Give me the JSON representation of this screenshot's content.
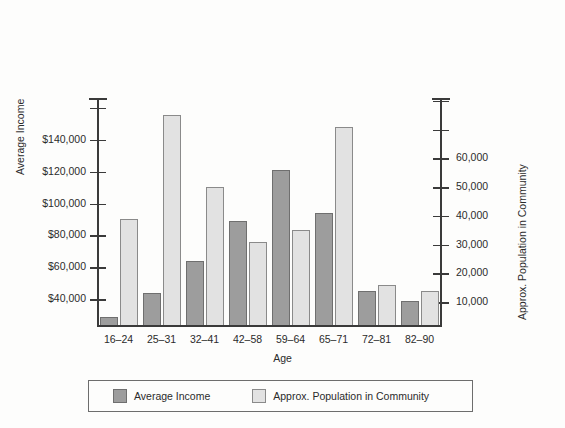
{
  "chart_data": {
    "type": "bar",
    "title": "",
    "xlabel": "Age",
    "categories": [
      "16–24",
      "25–31",
      "32–41",
      "42–58",
      "59–64",
      "65–71",
      "72–81",
      "82–90"
    ],
    "grid": false,
    "legend_position": "bottom",
    "series": [
      {
        "name": "Average Income",
        "axis": "left",
        "color": "#9d9d9d",
        "values": [
          29000,
          44000,
          64000,
          89000,
          121000,
          94000,
          45000,
          39000
        ]
      },
      {
        "name": "Approx. Population in Community",
        "axis": "right",
        "color": "#e2e2e2",
        "values": [
          39000,
          75000,
          50000,
          31000,
          35000,
          71000,
          16000,
          14000
        ]
      }
    ],
    "left_axis": {
      "label": "Average Income",
      "ticks": [
        40000,
        60000,
        80000,
        100000,
        120000,
        140000
      ],
      "tick_labels": [
        "$40,000",
        "$60,000",
        "$80,000",
        "$100,000",
        "$120,000",
        "$140,000"
      ],
      "ylim": [
        24000,
        166000
      ]
    },
    "right_axis": {
      "label": "Approx. Population in Community",
      "ticks": [
        10000,
        20000,
        30000,
        40000,
        50000,
        60000
      ],
      "tick_labels": [
        "10,000",
        "20,000",
        "30,000",
        "40,000",
        "50,000",
        "60,000"
      ],
      "ylim": [
        2000,
        81000
      ]
    }
  },
  "legend": {
    "items": [
      {
        "label": "Average Income"
      },
      {
        "label": "Approx. Population in Community"
      }
    ]
  }
}
